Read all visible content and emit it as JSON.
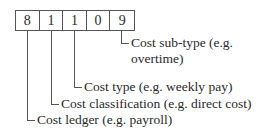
{
  "code": {
    "digits": [
      "8",
      "1",
      "1",
      "0",
      "9"
    ]
  },
  "labels": {
    "subtype_line1": "Cost sub-type (e.g.",
    "subtype_line2": "overtime)",
    "type": "Cost type (e.g. weekly pay)",
    "classification": "Cost classification (e.g. direct cost)",
    "ledger": "Cost ledger (e.g. payroll)"
  }
}
